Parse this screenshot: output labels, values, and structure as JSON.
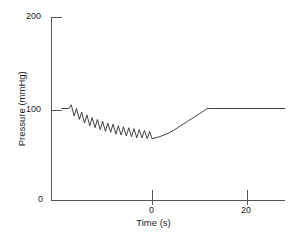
{
  "chart_data": {
    "type": "line",
    "title": "",
    "xlabel": "Time (s)",
    "ylabel": "Pressure (mmHg)",
    "xlim": [
      -19,
      28
    ],
    "ylim": [
      0,
      200
    ],
    "xticks": [
      0,
      20
    ],
    "xtick_labels": [
      "0",
      "20"
    ],
    "yticks": [
      0,
      100,
      200
    ],
    "ytick_labels": [
      "0",
      "100",
      "200"
    ],
    "grid": false,
    "legend": null,
    "line_color": "#2b2b2b",
    "axis_color": "#555555",
    "series": [
      {
        "name": "Arterial pressure",
        "description": "Baseline 100 mmHg, oscillatory decline to ~65 mmHg, smooth recovery to 100 mmHg plateau",
        "x": [
          -19.0,
          -17.5,
          -17.0,
          -16.4,
          -15.9,
          -15.3,
          -14.8,
          -14.2,
          -13.7,
          -13.1,
          -12.6,
          -12.0,
          -11.5,
          -10.9,
          -10.4,
          -9.8,
          -9.3,
          -8.7,
          -8.2,
          -7.6,
          -7.1,
          -6.5,
          -6.0,
          -5.4,
          -4.9,
          -4.3,
          -3.8,
          -3.2,
          -2.7,
          -2.1,
          -1.6,
          -1.0,
          -0.5,
          0.0,
          1.5,
          3.0,
          4.5,
          6.0,
          7.5,
          9.0,
          10.5,
          11.6,
          13.0,
          16.0,
          20.0,
          24.0,
          28.0
        ],
        "y": [
          100,
          100,
          104,
          92,
          100,
          88,
          96,
          84,
          93,
          81,
          90,
          79,
          88,
          77,
          86,
          75,
          84,
          74,
          83,
          72,
          81,
          71,
          80,
          70,
          79,
          69,
          78,
          68,
          77,
          68,
          76,
          67,
          75,
          67,
          69,
          72,
          76,
          81,
          86,
          91,
          96,
          100,
          100,
          100,
          100,
          100,
          100
        ]
      }
    ],
    "annotations": {
      "baseline_pressure": 100,
      "minimum_pressure": 65,
      "oscillation_start_time": -17.5,
      "oscillation_end_time": 0,
      "recovery_complete_time": 11.6,
      "plateau_pressure": 100
    }
  },
  "axes": {
    "y_title": "Pressure (mmHg)",
    "x_title": "Time (s)",
    "y_tick_200": "200",
    "y_tick_100": "100",
    "y_tick_0": "0",
    "x_tick_0": "0",
    "x_tick_20": "20"
  }
}
